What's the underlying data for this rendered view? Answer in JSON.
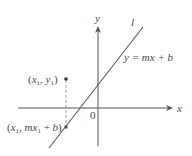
{
  "diagram": {
    "type": "coordinate-plane-line",
    "axes": {
      "x_label": "x",
      "y_label": "y",
      "origin_label": "0"
    },
    "line": {
      "name": "l",
      "equation": "y = mx + b"
    },
    "points": [
      {
        "label": "(x1, y1)",
        "parts": [
          "(",
          "x",
          "1",
          ", ",
          "y",
          "1",
          ")"
        ]
      },
      {
        "label": "(x1, mx1 + b)",
        "parts": [
          "(",
          "x",
          "1",
          ", ",
          "mx",
          "1",
          " + ",
          "b",
          ")"
        ]
      }
    ],
    "colors": {
      "axis": "#555555",
      "line": "#5a5a5a",
      "text": "#4a4a4a",
      "point": "#333333",
      "dashed": "#888888"
    }
  }
}
